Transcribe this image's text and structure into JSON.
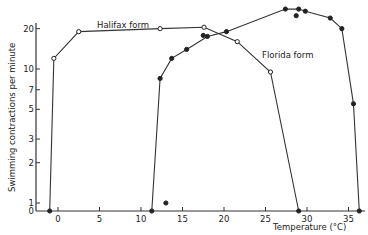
{
  "chart_data": {
    "type": "line",
    "title": "",
    "xlabel": "Temperature (°C)",
    "ylabel": "Swimming contractions per minute",
    "xlim": [
      -3,
      37
    ],
    "ylim": [
      0,
      30
    ],
    "yscale": "log (with 0 baseline)",
    "grid": false,
    "x_ticks": [
      "0",
      "5",
      "10",
      "15",
      "20",
      "25",
      "30",
      "35"
    ],
    "y_ticks": [
      "0",
      "1",
      "2",
      "3",
      "5",
      "7",
      "10",
      "20"
    ],
    "series": [
      {
        "name": "Halifax form",
        "marker": "open-circle",
        "points": [
          {
            "x": -1,
            "y": 0
          },
          {
            "x": -0.5,
            "y": 12
          },
          {
            "x": 2.5,
            "y": 19
          },
          {
            "x": 12.3,
            "y": 20
          },
          {
            "x": 17.6,
            "y": 20.5
          },
          {
            "x": 21.6,
            "y": 16
          },
          {
            "x": 25.6,
            "y": 9.5
          },
          {
            "x": 29,
            "y": 0
          }
        ]
      },
      {
        "name": "Florida form",
        "marker": "filled-circle",
        "points": [
          {
            "x": 11.3,
            "y": 0
          },
          {
            "x": 12.3,
            "y": 8.5
          },
          {
            "x": 13.7,
            "y": 12
          },
          {
            "x": 15.5,
            "y": 14
          },
          {
            "x": 18,
            "y": 17.5
          },
          {
            "x": 20.3,
            "y": 19
          },
          {
            "x": 27.4,
            "y": 28
          },
          {
            "x": 29,
            "y": 28
          },
          {
            "x": 29.8,
            "y": 27
          },
          {
            "x": 32.8,
            "y": 24
          },
          {
            "x": 34.2,
            "y": 20
          },
          {
            "x": 35.6,
            "y": 5.5
          },
          {
            "x": 36.3,
            "y": 0
          }
        ],
        "extra_points": [
          {
            "x": 13,
            "y": 1
          },
          {
            "x": 17.5,
            "y": 17.8
          },
          {
            "x": 28.7,
            "y": 25
          }
        ]
      }
    ],
    "annotations": [
      {
        "text": "Halifax form",
        "near": {
          "x": 8,
          "y": 21
        }
      },
      {
        "text": "Florida form",
        "near": {
          "x": 27,
          "y": 14
        }
      }
    ],
    "legend": "inline labels"
  },
  "labels": {
    "halifax": "Halifax form",
    "florida": "Florida form",
    "xlabel": "Temperature (°C)",
    "ylabel": "Swimming contractions per minute"
  }
}
